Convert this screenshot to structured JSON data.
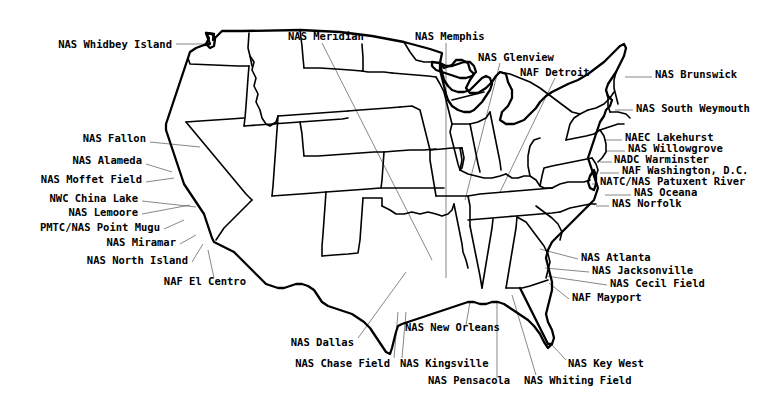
{
  "map": {
    "title": "U.S. Naval Air Stations Location Map",
    "region": "Continental United States",
    "background_color": "#ffffff",
    "outline_color": "#000000",
    "leader_line_color": "#555555",
    "label_color": "#000000"
  },
  "labels": [
    {
      "id": "nas-whidbey-island",
      "text": "NAS Whidbey Island",
      "x": 172,
      "y": 44,
      "align": "right",
      "leader": [
        [
          176,
          44
        ],
        [
          210,
          44
        ]
      ]
    },
    {
      "id": "nas-meridian",
      "text": "NAS Meridian",
      "x": 288,
      "y": 36,
      "align": "left",
      "leader": [
        [
          322,
          43
        ],
        [
          432,
          260
        ]
      ]
    },
    {
      "id": "nas-memphis",
      "text": "NAS Memphis",
      "x": 415,
      "y": 36,
      "align": "left",
      "leader": [
        [
          446,
          43
        ],
        [
          446,
          278
        ]
      ]
    },
    {
      "id": "nas-glenview",
      "text": "NAS Glenview",
      "x": 478,
      "y": 57,
      "align": "left",
      "leader": [
        [
          500,
          63
        ],
        [
          465,
          200
        ]
      ]
    },
    {
      "id": "naf-detroit",
      "text": "NAF Detroit",
      "x": 520,
      "y": 72,
      "align": "left",
      "leader": [
        [
          555,
          78
        ],
        [
          500,
          192
        ]
      ]
    },
    {
      "id": "nas-brunswick",
      "text": "NAS Brunswick",
      "x": 655,
      "y": 74,
      "align": "left",
      "leader": [
        [
          625,
          77
        ],
        [
          652,
          77
        ]
      ]
    },
    {
      "id": "nas-south-weymouth",
      "text": "NAS South Weymouth",
      "x": 636,
      "y": 108,
      "align": "left",
      "leader": [
        [
          615,
          110
        ],
        [
          633,
          110
        ]
      ]
    },
    {
      "id": "naec-lakehurst",
      "text": "NAEC Lakehurst",
      "x": 625,
      "y": 137,
      "align": "left",
      "leader": [
        [
          605,
          140
        ],
        [
          622,
          140
        ]
      ]
    },
    {
      "id": "nas-willowgrove",
      "text": "NAS Willowgrove",
      "x": 628,
      "y": 148,
      "align": "left",
      "leader": [
        [
          606,
          151
        ],
        [
          625,
          151
        ]
      ]
    },
    {
      "id": "nadc-warminster",
      "text": "NADC Warminster",
      "x": 614,
      "y": 159,
      "align": "left",
      "leader": [
        [
          600,
          162
        ],
        [
          612,
          162
        ]
      ]
    },
    {
      "id": "naf-washington-dc",
      "text": "NAF Washington, D.C.",
      "x": 622,
      "y": 170,
      "align": "left",
      "leader": [
        [
          600,
          173
        ],
        [
          619,
          173
        ]
      ]
    },
    {
      "id": "natc-nas-patuxent-river",
      "text": "NATC/NAS Patuxent River",
      "x": 600,
      "y": 181,
      "align": "left",
      "leader": [
        [
          592,
          184
        ],
        [
          598,
          184
        ]
      ]
    },
    {
      "id": "nas-oceana",
      "text": "NAS Oceana",
      "x": 634,
      "y": 192,
      "align": "left",
      "leader": [
        [
          605,
          195
        ],
        [
          631,
          195
        ]
      ]
    },
    {
      "id": "nas-norfolk",
      "text": "NAS Norfolk",
      "x": 612,
      "y": 203,
      "align": "left",
      "leader": [
        [
          596,
          206
        ],
        [
          609,
          206
        ]
      ]
    },
    {
      "id": "nas-fallon",
      "text": "NAS Fallon",
      "x": 146,
      "y": 138,
      "align": "right",
      "leader": [
        [
          150,
          142
        ],
        [
          200,
          147
        ]
      ]
    },
    {
      "id": "nas-alameda",
      "text": "NAS Alameda",
      "x": 142,
      "y": 160,
      "align": "right",
      "leader": [
        [
          146,
          164
        ],
        [
          172,
          172
        ]
      ]
    },
    {
      "id": "nas-moffet-field",
      "text": "NAS Moffet Field",
      "x": 142,
      "y": 179,
      "align": "right",
      "leader": [
        [
          146,
          182
        ],
        [
          174,
          178
        ]
      ]
    },
    {
      "id": "nwc-china-lake",
      "text": "NWC China Lake",
      "x": 138,
      "y": 198,
      "align": "right",
      "leader": [
        [
          142,
          201
        ],
        [
          196,
          207
        ]
      ]
    },
    {
      "id": "nas-lemoore",
      "text": "NAS Lemoore",
      "x": 138,
      "y": 212,
      "align": "right",
      "leader": [
        [
          142,
          214
        ],
        [
          190,
          205
        ]
      ]
    },
    {
      "id": "pmtc-nas-point-mugu",
      "text": "PMTC/NAS Point Mugu",
      "x": 160,
      "y": 227,
      "align": "right",
      "leader": [
        [
          164,
          229
        ],
        [
          184,
          220
        ]
      ]
    },
    {
      "id": "nas-miramar",
      "text": "NAS Miramar",
      "x": 176,
      "y": 242,
      "align": "right",
      "leader": [
        [
          180,
          244
        ],
        [
          196,
          235
        ]
      ]
    },
    {
      "id": "nas-north-island",
      "text": "NAS North Island",
      "x": 188,
      "y": 260,
      "align": "right",
      "leader": [
        [
          192,
          262
        ],
        [
          203,
          244
        ]
      ]
    },
    {
      "id": "naf-el-centro",
      "text": "NAF El Centro",
      "x": 246,
      "y": 281,
      "align": "right",
      "leader": [
        [
          214,
          278
        ],
        [
          208,
          250
        ]
      ]
    },
    {
      "id": "nas-atlanta",
      "text": "NAS Atlanta",
      "x": 581,
      "y": 257,
      "align": "left",
      "leader": [
        [
          578,
          259
        ],
        [
          540,
          249
        ]
      ]
    },
    {
      "id": "nas-jacksonville",
      "text": "NAS Jacksonville",
      "x": 592,
      "y": 270,
      "align": "left",
      "leader": [
        [
          589,
          272
        ],
        [
          545,
          268
        ]
      ]
    },
    {
      "id": "nas-cecil-field",
      "text": "NAS Cecil Field",
      "x": 610,
      "y": 283,
      "align": "left",
      "leader": [
        [
          607,
          285
        ],
        [
          546,
          276
        ]
      ]
    },
    {
      "id": "naf-mayport",
      "text": "NAF Mayport",
      "x": 572,
      "y": 297,
      "align": "left",
      "leader": [
        [
          569,
          299
        ],
        [
          549,
          283
        ]
      ]
    },
    {
      "id": "nas-dallas",
      "text": "NAS Dallas",
      "x": 354,
      "y": 342,
      "align": "right",
      "leader": [
        [
          358,
          338
        ],
        [
          406,
          272
        ]
      ]
    },
    {
      "id": "nas-new-orleans",
      "text": "NAS New Orleans",
      "x": 405,
      "y": 327,
      "align": "left",
      "leader": [
        [
          466,
          325
        ],
        [
          470,
          302
        ]
      ]
    },
    {
      "id": "nas-chase-field",
      "text": "NAS Chase Field",
      "x": 390,
      "y": 363,
      "align": "right",
      "leader": [
        [
          394,
          358
        ],
        [
          398,
          312
        ]
      ]
    },
    {
      "id": "nas-kingsville",
      "text": "NAS Kingsville",
      "x": 400,
      "y": 363,
      "align": "left",
      "leader": [
        [
          402,
          358
        ],
        [
          406,
          312
        ]
      ]
    },
    {
      "id": "nas-pensacola",
      "text": "NAS Pensacola",
      "x": 428,
      "y": 380,
      "align": "left",
      "leader": [
        [
          497,
          378
        ],
        [
          497,
          301
        ]
      ]
    },
    {
      "id": "nas-whiting-field",
      "text": "NAS Whiting Field",
      "x": 524,
      "y": 380,
      "align": "left",
      "leader": [
        [
          536,
          375
        ],
        [
          512,
          295
        ]
      ]
    },
    {
      "id": "nas-key-west",
      "text": "NAS Key West",
      "x": 568,
      "y": 363,
      "align": "left",
      "leader": [
        [
          566,
          360
        ],
        [
          552,
          345
        ]
      ]
    }
  ]
}
